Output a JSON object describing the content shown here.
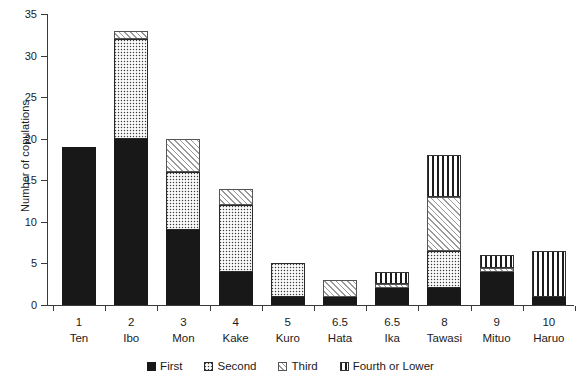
{
  "chart_data": {
    "type": "bar",
    "title": "",
    "subtitle": "",
    "xlabel": "",
    "ylabel": "Number of copulations",
    "ylim": [
      0,
      35
    ],
    "yticks": [
      0,
      5,
      10,
      15,
      20,
      25,
      30,
      35
    ],
    "grid": false,
    "stacked": true,
    "legend_position": "bottom",
    "categories": [
      "Ten",
      "Ibo",
      "Mon",
      "Kake",
      "Kuro",
      "Hata",
      "Ika",
      "Tawasi",
      "Mituo",
      "Haruo"
    ],
    "rank_labels": [
      "1",
      "2",
      "3",
      "4",
      "5",
      "6.5",
      "6.5",
      "8",
      "9",
      "10"
    ],
    "series": [
      {
        "name": "First",
        "fill": "solid-black",
        "values": [
          19,
          20,
          9,
          4,
          1,
          1,
          2,
          2,
          4,
          1
        ]
      },
      {
        "name": "Second",
        "fill": "dark-checker",
        "values": [
          0,
          12,
          7,
          8,
          4,
          0,
          0,
          4.5,
          0,
          0
        ]
      },
      {
        "name": "Third",
        "fill": "light-diagonal-hatch",
        "values": [
          0,
          1,
          4,
          2,
          0,
          2,
          0.5,
          6.5,
          0.5,
          0
        ]
      },
      {
        "name": "Fourth or Lower",
        "fill": "vertical-stripes",
        "values": [
          0,
          0,
          0,
          0,
          0,
          0,
          1.5,
          5,
          1.5,
          5.5
        ]
      }
    ],
    "totals": [
      19,
      33,
      20,
      14,
      5,
      3,
      4,
      18,
      6,
      6.5
    ]
  },
  "legend": {
    "items": [
      {
        "label": "First",
        "swatch": "solid-black-swatch"
      },
      {
        "label": "Second",
        "swatch": "dark-checker-swatch"
      },
      {
        "label": "Third",
        "swatch": "light-hatch-swatch"
      },
      {
        "label": "Fourth or Lower",
        "swatch": "vertical-stripe-swatch"
      }
    ]
  },
  "colors": {
    "axis": "#3a3a3a",
    "first": "#181818",
    "second": "#3c3c3c",
    "third": "#ffffff",
    "fourth": "#ffffff",
    "background": "#ffffff"
  }
}
